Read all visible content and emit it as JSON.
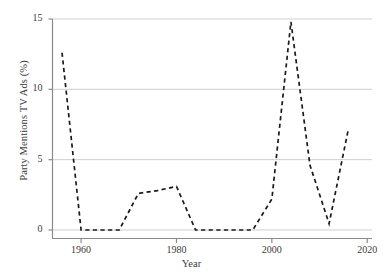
{
  "chart_data": {
    "type": "line",
    "title": "",
    "xlabel": "Year",
    "ylabel": "Party Mentions TV Ads (%)",
    "xlim": [
      1954,
      2021
    ],
    "ylim": [
      0,
      15
    ],
    "xticks": [
      1960,
      1980,
      2000,
      2020
    ],
    "xtick_labels": [
      "1960",
      "1980",
      "2000",
      "2020"
    ],
    "yticks": [
      0,
      5,
      10,
      15
    ],
    "ytick_labels": [
      "0",
      "5",
      "10",
      "15"
    ],
    "grid": "horizontal",
    "legend": "none",
    "line_style": "dashed",
    "line_color": "#1a1a1a",
    "grid_color": "#cfcfcf",
    "axis_color": "#808080",
    "background_color": "#ffffff",
    "series": [
      {
        "name": "Party Mentions TV Ads (%)",
        "x": [
          1956,
          1960,
          1964,
          1968,
          1972,
          1976,
          1980,
          1984,
          1988,
          1992,
          1996,
          2000,
          2004,
          2008,
          2012,
          2016
        ],
        "values": [
          12.6,
          0.0,
          0.0,
          0.0,
          2.6,
          2.8,
          3.1,
          0.0,
          0.0,
          0.0,
          0.0,
          2.2,
          14.8,
          4.6,
          0.45,
          7.1
        ]
      }
    ]
  },
  "axis": {
    "y_label": "Party Mentions TV Ads (%)",
    "x_label": "Year"
  }
}
